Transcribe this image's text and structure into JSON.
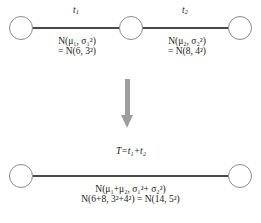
{
  "diagram": {
    "colors": {
      "edge": "#4a4a4a",
      "node_stroke": "#8a8a8a",
      "arrow": "#9e9e9e",
      "text": "#1a1a1a",
      "background": "#ffffff"
    },
    "top_row": {
      "segments": [
        {
          "edge_label": "t₁",
          "edge_label_base": "t",
          "edge_label_sub": "1",
          "dist_line1": "N(μ₁, σ₁²)",
          "dist_line2": "= N(6, 3²)",
          "mean": 6,
          "sd": 3
        },
        {
          "edge_label": "t₂",
          "edge_label_base": "t",
          "edge_label_sub": "2",
          "dist_line1": "N(μ₂, σ₂²)",
          "dist_line2": "= N(8, 4²)",
          "mean": 8,
          "sd": 4
        }
      ],
      "nodes": [
        "start",
        "middle",
        "end"
      ]
    },
    "arrow": {
      "name": "down-arrow-icon",
      "direction": "down"
    },
    "bottom_row": {
      "edge_label": "T=t₁+t₂",
      "dist_line1": "N(μ₁+μ₂, σ₁²+ σ₂²)",
      "dist_line2": "N(6+8, 3²+4²) = N(14, 5²)",
      "total_mean": 14,
      "total_sd": 5,
      "nodes": [
        "start",
        "end"
      ]
    }
  }
}
